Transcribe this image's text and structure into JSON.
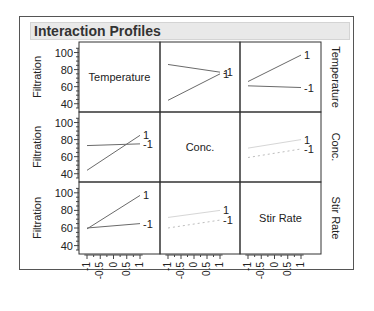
{
  "panel": {
    "title": "Interaction Profiles"
  },
  "chart_data": {
    "type": "line",
    "title": "Interaction Profiles",
    "layout": "3x3 matrix of interaction plots",
    "factors": [
      "Temperature",
      "Conc.",
      "Stir Rate"
    ],
    "response": "Filtration",
    "ylabel": "Filtration",
    "ylim": [
      35,
      110
    ],
    "y_ticks": [
      "100",
      "80",
      "60",
      "40"
    ],
    "x_ticks": [
      "-1",
      "-0.5",
      "0",
      "0.5",
      "1"
    ],
    "xlim": [
      -1,
      1
    ],
    "grid": false,
    "row_labels_right": [
      "Temperature",
      "Conc.",
      "Stir Rate"
    ],
    "cells": [
      {
        "row": 0,
        "col": 0,
        "kind": "label",
        "label": "Temperature"
      },
      {
        "row": 0,
        "col": 1,
        "x_factor": "Conc.",
        "legend_factor": "Temperature",
        "series": [
          {
            "name": "-1",
            "x": [
              -1,
              1
            ],
            "values": [
              86,
              77
            ]
          },
          {
            "name": "1",
            "x": [
              -1,
              1
            ],
            "values": [
              44,
              75
            ]
          }
        ]
      },
      {
        "row": 0,
        "col": 2,
        "x_factor": "Stir Rate",
        "legend_factor": "Temperature",
        "series": [
          {
            "name": "1",
            "x": [
              -1,
              1
            ],
            "values": [
              66,
              97
            ]
          },
          {
            "name": "-1",
            "x": [
              -1,
              1
            ],
            "values": [
              61,
              59
            ]
          }
        ]
      },
      {
        "row": 1,
        "col": 0,
        "x_factor": "Temperature",
        "legend_factor": "Conc.",
        "series": [
          {
            "name": "-1",
            "x": [
              -1,
              1
            ],
            "values": [
              73,
              75
            ]
          },
          {
            "name": "1",
            "x": [
              -1,
              1
            ],
            "values": [
              44,
              85
            ]
          }
        ]
      },
      {
        "row": 1,
        "col": 1,
        "kind": "label",
        "label": "Conc."
      },
      {
        "row": 1,
        "col": 2,
        "x_factor": "Stir Rate",
        "legend_factor": "Conc.",
        "series": [
          {
            "name": "1",
            "x": [
              -1,
              1
            ],
            "values": [
              70,
              80
            ]
          },
          {
            "name": "-1",
            "x": [
              -1,
              1
            ],
            "values": [
              59,
              69
            ]
          }
        ]
      },
      {
        "row": 2,
        "col": 0,
        "x_factor": "Temperature",
        "legend_factor": "Stir Rate",
        "series": [
          {
            "name": "1",
            "x": [
              -1,
              1
            ],
            "values": [
              59,
              97
            ]
          },
          {
            "name": "-1",
            "x": [
              -1,
              1
            ],
            "values": [
              60,
              65
            ]
          }
        ]
      },
      {
        "row": 2,
        "col": 1,
        "x_factor": "Conc.",
        "legend_factor": "Stir Rate",
        "series": [
          {
            "name": "1",
            "x": [
              -1,
              1
            ],
            "values": [
              72,
              80
            ]
          },
          {
            "name": "-1",
            "x": [
              -1,
              1
            ],
            "values": [
              60,
              69
            ]
          }
        ]
      },
      {
        "row": 2,
        "col": 2,
        "kind": "label",
        "label": "Stir Rate"
      }
    ]
  },
  "colors": {
    "frame": "#555555",
    "grid_border": "#333333",
    "title_bg": "#e9e9e9",
    "line_dark": "#6a6a6a",
    "line_light": "#cfcfcf",
    "text": "#222222"
  }
}
